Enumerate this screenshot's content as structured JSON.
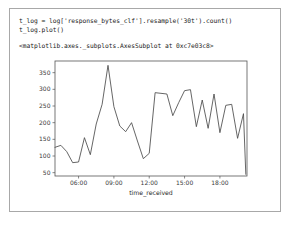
{
  "notebook": {
    "cell": {
      "code_lines": [
        "t_log = log['response_bytes_clf'].resample('30t').count()",
        "t_log.plot()"
      ],
      "output_text": "<matplotlib.axes._subplots.AxesSubplot at 0xc7e03c8>"
    }
  },
  "chart_data": {
    "type": "line",
    "title": "",
    "xlabel": "time_received",
    "ylabel": "",
    "xtick_labels": [
      "06:00",
      "09:00",
      "12:00",
      "15:00",
      "18:00"
    ],
    "xtick_values": [
      6,
      9,
      12,
      15,
      18
    ],
    "ytick_labels": [
      "50",
      "100",
      "150",
      "200",
      "250",
      "300",
      "350"
    ],
    "ytick_values": [
      50,
      100,
      150,
      200,
      250,
      300,
      350
    ],
    "xlim": [
      4.0,
      20.3
    ],
    "ylim": [
      40,
      385
    ],
    "grid": false,
    "legend": false,
    "line_color": "#4a4a4a",
    "series": [
      {
        "name": "response_bytes_clf",
        "x": [
          4.0,
          4.5,
          5.0,
          5.5,
          6.0,
          6.5,
          7.0,
          7.5,
          8.0,
          8.5,
          9.0,
          9.5,
          10.0,
          10.5,
          11.0,
          11.5,
          12.0,
          12.5,
          13.0,
          13.5,
          14.0,
          14.5,
          15.0,
          15.5,
          16.0,
          16.5,
          17.0,
          17.5,
          18.0,
          18.5,
          19.0,
          19.5,
          20.0,
          20.2
        ],
        "values": [
          126,
          132,
          113,
          80,
          82,
          155,
          104,
          196,
          255,
          372,
          248,
          190,
          173,
          200,
          145,
          92,
          108,
          290,
          288,
          286,
          221,
          260,
          296,
          299,
          188,
          268,
          183,
          286,
          170,
          252,
          255,
          153,
          227,
          45
        ]
      }
    ]
  }
}
